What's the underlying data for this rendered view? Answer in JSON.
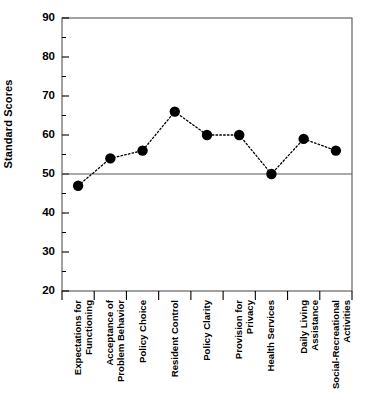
{
  "chart_data": {
    "type": "line",
    "title": "",
    "xlabel": "",
    "ylabel": "Standard Scores",
    "categories": [
      "Expectations for\nFunctioning",
      "Acceptance of\nProblem Behavior",
      "Policy Choice",
      "Resident Control",
      "Policy Clarity",
      "Provision for\nPrivacy",
      "Health Services",
      "Daily Living\nAssistance",
      "Social-Recreational\nActivities"
    ],
    "values": [
      47,
      54,
      56,
      66,
      60,
      60,
      50,
      59,
      56
    ],
    "ylim": [
      20,
      90
    ],
    "yticks": [
      20,
      30,
      40,
      50,
      60,
      70,
      80,
      90
    ],
    "ytick_labels": [
      "20",
      "30",
      "40",
      "50",
      "60",
      "70",
      "80",
      "90"
    ],
    "minor_tick_step": 5,
    "grid": false,
    "legend": null,
    "reference_line": {
      "value": 50,
      "orientation": "horizontal"
    },
    "series_style": {
      "line": "dotted",
      "marker": "filled-circle",
      "color": "#000000"
    }
  },
  "axis": {
    "y_title": "Standard Scores"
  }
}
